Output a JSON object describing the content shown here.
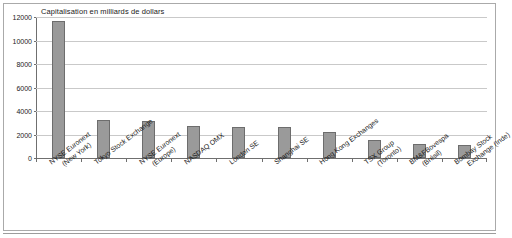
{
  "chart_data": {
    "type": "bar",
    "title": "Capitalisation en milliards de dollars",
    "xlabel": "",
    "ylabel": "",
    "ylim": [
      0,
      12000
    ],
    "ytick_step": 2000,
    "grid": true,
    "legend": "none",
    "bar_color": "#9a9a9a",
    "bar_border_color": "#6d6d6d",
    "categories": [
      "NYSE Euronext (New York)",
      "Tokyo Stock Exchange",
      "NYSE Euronext (Europe)",
      "NASDAQ OMX",
      "London SE",
      "Shanghai SE",
      "Hong Kong Exchanges",
      "TSX Group (Toronto)",
      "BM&FBovespa (Brésil)",
      "Bombay Stock Exchange (Inde)"
    ],
    "category_lines": [
      [
        "NYSE Euronext",
        "(New York)"
      ],
      [
        "Tokyo Stock Exchange",
        ""
      ],
      [
        "NYSE Euronext",
        "(Europe)"
      ],
      [
        "NASDAQ OMX",
        ""
      ],
      [
        "London SE",
        ""
      ],
      [
        "Shanghai SE",
        ""
      ],
      [
        "Hong Kong Exchanges",
        ""
      ],
      [
        "TSX Group",
        "(Toronto)"
      ],
      [
        "BM&FBovespa",
        "(Brésil)"
      ],
      [
        "Bombay Stock",
        "Exchange (Inde)"
      ]
    ],
    "values": [
      11700,
      3200,
      3150,
      2750,
      2650,
      2600,
      2200,
      1500,
      1200,
      1150
    ],
    "ytick_labels": [
      "0",
      "2000",
      "4000",
      "6000",
      "8000",
      "10000",
      "12000"
    ],
    "ytick_values": [
      0,
      2000,
      4000,
      6000,
      8000,
      10000,
      12000
    ]
  }
}
